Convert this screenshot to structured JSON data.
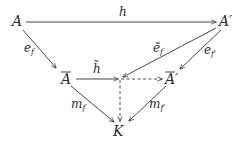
{
  "diagram": {
    "type": "commutative-diagram",
    "nodes": {
      "A": {
        "label": "A",
        "x": 18,
        "y": 26
      },
      "A_prime": {
        "label": "A′",
        "x": 226,
        "y": 26
      },
      "A_bar": {
        "label": "A",
        "overline": true,
        "x": 67,
        "y": 84
      },
      "A_bar_prime": {
        "label": "A′",
        "overline": true,
        "x": 170,
        "y": 84
      },
      "junction": {
        "label": "",
        "x": 120,
        "y": 79
      },
      "K": {
        "label": "K",
        "x": 119,
        "y": 135
      }
    },
    "edges": [
      {
        "from": "A",
        "to": "A_prime",
        "label": "h",
        "style": "solid"
      },
      {
        "from": "A",
        "to": "A_bar",
        "label_main": "e",
        "label_sub": "f",
        "style": "solid"
      },
      {
        "from": "A_prime",
        "to": "junction",
        "label_main": "ẽ",
        "label_sub": "f",
        "style": "solid"
      },
      {
        "from": "A_prime",
        "to": "A_bar_prime",
        "label_main": "e",
        "label_sub": "f′",
        "style": "solid"
      },
      {
        "from": "A_bar",
        "to": "junction",
        "label": "h̃",
        "style": "solid"
      },
      {
        "from": "junction",
        "to": "A_bar_prime",
        "label": "",
        "style": "dashed"
      },
      {
        "from": "junction",
        "to": "K",
        "label": "",
        "style": "dashed"
      },
      {
        "from": "A_bar",
        "to": "K",
        "label_main": "m",
        "label_sub": "f",
        "style": "solid"
      },
      {
        "from": "A_bar_prime",
        "to": "K",
        "label_main": "m",
        "label_sub": "f′",
        "style": "solid"
      }
    ],
    "edge_labels": {
      "h": "h",
      "e_f": "e",
      "e_f_sub": "f",
      "e_tilde_f": "ẽ",
      "e_tilde_f_sub": "f",
      "e_f_prime": "e",
      "e_f_prime_sub": "f′",
      "h_tilde": "h̃",
      "m_f": "m",
      "m_f_sub": "f",
      "m_f_prime": "m",
      "m_f_prime_sub": "f′"
    }
  }
}
